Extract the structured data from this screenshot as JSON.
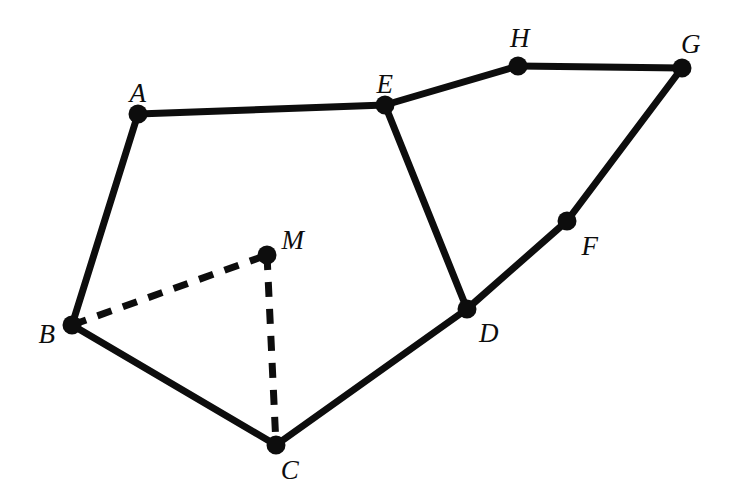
{
  "figure": {
    "kind": "geometry-diagram",
    "background_color": "#ffffff",
    "stroke_color": "#0d0d0d",
    "solid_stroke_width": 7,
    "dashed_stroke_width": 7,
    "dash_pattern": "15 12",
    "vertex_dot_radius": 9.5,
    "width": 740,
    "height": 501
  },
  "vertices": [
    {
      "id": "A",
      "label": "A",
      "x": 138,
      "y": 114,
      "label_x": 138,
      "label_y": 93
    },
    {
      "id": "B",
      "label": "B",
      "x": 72,
      "y": 325,
      "label_x": 47,
      "label_y": 334
    },
    {
      "id": "C",
      "label": "C",
      "x": 276,
      "y": 445,
      "label_x": 290,
      "label_y": 470
    },
    {
      "id": "D",
      "label": "D",
      "x": 467,
      "y": 309,
      "label_x": 489,
      "label_y": 333
    },
    {
      "id": "E",
      "label": "E",
      "x": 385,
      "y": 105,
      "label_x": 385,
      "label_y": 84
    },
    {
      "id": "F",
      "label": "F",
      "x": 567,
      "y": 221,
      "label_x": 590,
      "label_y": 246
    },
    {
      "id": "G",
      "label": "G",
      "x": 682,
      "y": 68,
      "label_x": 691,
      "label_y": 44
    },
    {
      "id": "H",
      "label": "H",
      "x": 518,
      "y": 66,
      "label_x": 520,
      "label_y": 38
    },
    {
      "id": "M",
      "label": "M",
      "x": 267,
      "y": 255,
      "label_x": 293,
      "label_y": 240
    }
  ],
  "edges": [
    {
      "name": "edge-A-E",
      "from": "A",
      "to": "E",
      "style": "solid"
    },
    {
      "name": "edge-A-B",
      "from": "A",
      "to": "B",
      "style": "solid"
    },
    {
      "name": "edge-B-C",
      "from": "B",
      "to": "C",
      "style": "solid"
    },
    {
      "name": "edge-C-D",
      "from": "C",
      "to": "D",
      "style": "solid"
    },
    {
      "name": "edge-D-E",
      "from": "D",
      "to": "E",
      "style": "solid"
    },
    {
      "name": "edge-E-H",
      "from": "E",
      "to": "H",
      "style": "solid"
    },
    {
      "name": "edge-H-G",
      "from": "H",
      "to": "G",
      "style": "solid"
    },
    {
      "name": "edge-G-F",
      "from": "G",
      "to": "F",
      "style": "solid"
    },
    {
      "name": "edge-F-D",
      "from": "F",
      "to": "D",
      "style": "solid"
    },
    {
      "name": "edge-B-M",
      "from": "B",
      "to": "M",
      "style": "dashed"
    },
    {
      "name": "edge-M-C",
      "from": "M",
      "to": "C",
      "style": "dashed"
    }
  ]
}
